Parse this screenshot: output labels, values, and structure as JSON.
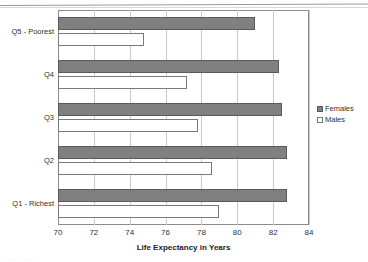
{
  "chart_data": {
    "type": "bar",
    "orientation": "horizontal",
    "title": "",
    "xlabel": "Life Expectancy in Years",
    "ylabel": "",
    "xlim": [
      70,
      84
    ],
    "xticks": [
      70,
      72,
      74,
      76,
      78,
      80,
      82,
      84
    ],
    "grid": true,
    "legend_position": "right",
    "categories": [
      "Q5 - Poorest",
      "Q4",
      "Q3",
      "Q2",
      "Q1 - Richest"
    ],
    "series": [
      {
        "name": "Females",
        "color": "#808080",
        "values": [
          81.0,
          82.3,
          82.5,
          82.8,
          82.8
        ]
      },
      {
        "name": "Males",
        "color": "#ffffff",
        "values": [
          74.8,
          77.2,
          77.8,
          78.6,
          79.0
        ]
      }
    ]
  },
  "legend": {
    "items": [
      {
        "label": "Females"
      },
      {
        "label": "Males"
      }
    ]
  },
  "artifact": {
    "footer_fragment": "·   ····   ··  ···· ··"
  }
}
